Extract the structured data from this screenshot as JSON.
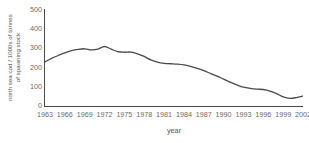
{
  "chart_data": {
    "type": "line",
    "title": "",
    "xlabel": "year",
    "ylabel": "north sea cod / 1000s of tonnes of spawning stock",
    "ylabel_lines": [
      "north sea cod / 1000s of tonnes",
      "of spawning stock"
    ],
    "grid": false,
    "legend": false,
    "legend_position": "none",
    "xlim": [
      1963,
      2002
    ],
    "ylim": [
      0,
      500
    ],
    "ytick_labels": [
      "500",
      "400",
      "300",
      "200",
      "100",
      "0"
    ],
    "ytick_values": [
      500,
      400,
      300,
      200,
      100,
      0
    ],
    "xtick_labels": [
      "1963",
      "1966",
      "1969",
      "1972",
      "1975",
      "1978",
      "1981",
      "1984",
      "1987",
      "1990",
      "1993",
      "1996",
      "1999",
      "2002"
    ],
    "xtick_values": [
      1963,
      1966,
      1969,
      1972,
      1975,
      1978,
      1981,
      1984,
      1987,
      1990,
      1993,
      1996,
      1999,
      2002
    ],
    "line_color": "#4a4a4a",
    "line_width": 1.3,
    "x": [
      1963,
      1964,
      1965,
      1966,
      1967,
      1968,
      1969,
      1970,
      1971,
      1972,
      1973,
      1974,
      1975,
      1976,
      1977,
      1978,
      1979,
      1980,
      1981,
      1982,
      1983,
      1984,
      1985,
      1986,
      1987,
      1988,
      1989,
      1990,
      1991,
      1992,
      1993,
      1994,
      1995,
      1996,
      1997,
      1998,
      1999,
      2000,
      2001,
      2002
    ],
    "values": [
      230,
      248,
      263,
      277,
      288,
      295,
      298,
      292,
      296,
      310,
      296,
      283,
      280,
      281,
      272,
      258,
      240,
      228,
      222,
      220,
      218,
      214,
      206,
      196,
      184,
      170,
      156,
      140,
      124,
      110,
      98,
      92,
      88,
      86,
      78,
      64,
      48,
      40,
      44,
      52
    ],
    "series": [
      {
        "name": "north sea cod spawning stock",
        "values": [
          230,
          248,
          263,
          277,
          288,
          295,
          298,
          292,
          296,
          310,
          296,
          283,
          280,
          281,
          272,
          258,
          240,
          228,
          222,
          220,
          218,
          214,
          206,
          196,
          184,
          170,
          156,
          140,
          124,
          110,
          98,
          92,
          88,
          86,
          78,
          64,
          48,
          40,
          44,
          52
        ]
      }
    ]
  }
}
